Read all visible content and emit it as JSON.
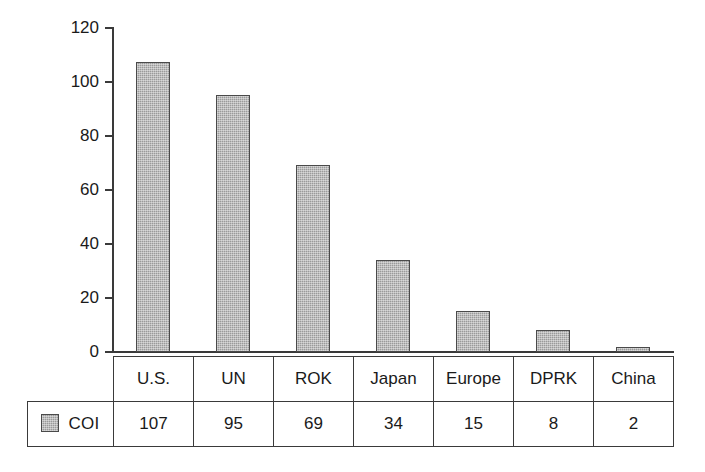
{
  "chart_data": {
    "type": "bar",
    "title": "",
    "subtitle": "",
    "xlabel": "",
    "ylabel": "",
    "categories": [
      "U.S.",
      "UN",
      "ROK",
      "Japan",
      "Europe",
      "DPRK",
      "China"
    ],
    "series": [
      {
        "name": "COI",
        "values": [
          107,
          95,
          69,
          34,
          15,
          8,
          2
        ],
        "color": "#9a9a9a",
        "outline_color": "#4a4a4a"
      }
    ],
    "ylim": [
      0,
      120
    ],
    "ytick_values": [
      0,
      20,
      40,
      60,
      80,
      100,
      120
    ],
    "ytick_labels": [
      "0",
      "20",
      "40",
      "60",
      "80",
      "100",
      "120"
    ],
    "grid": false,
    "legend_position": "data-table-row",
    "has_data_table": true,
    "annotations": []
  },
  "table": {
    "legend_label": "COI",
    "header_cells": [
      "U.S.",
      "UN",
      "ROK",
      "Japan",
      "Europe",
      "DPRK",
      "China"
    ],
    "value_cells": [
      "107",
      "95",
      "69",
      "34",
      "15",
      "8",
      "2"
    ]
  },
  "axis": {
    "ticks": [
      "120",
      "100",
      "80",
      "60",
      "40",
      "20",
      "0"
    ]
  }
}
